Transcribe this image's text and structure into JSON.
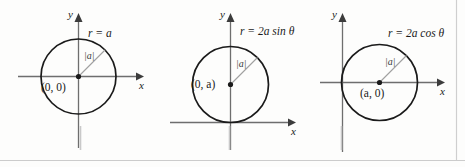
{
  "figure": {
    "title_alt": "Three polar-coordinate circle graphs",
    "background_color": "#fdfdfc",
    "curve_color": "#1a1a1a",
    "axis_color": "#6e6e6e",
    "radius_color": "#9a9a9a",
    "rule_color": "#c8c8c8"
  },
  "panels": [
    {
      "id": "panel-center-origin",
      "equation": "r = a",
      "equation_parts": {
        "lhs": "r",
        "eq": "=",
        "rhs": "a"
      },
      "center_label": "(0, 0)",
      "radius_label": "|a|",
      "x_axis_label": "x",
      "y_axis_label": "y",
      "center": {
        "x": 0,
        "y": 0
      },
      "radius_expr": "a"
    },
    {
      "id": "panel-center-on-y",
      "equation": "r = 2a sin θ",
      "equation_parts": {
        "lhs": "r",
        "eq": "=",
        "rhs": "2a sin θ"
      },
      "center_label": "(0, a)",
      "radius_label": "|a|",
      "x_axis_label": "x",
      "y_axis_label": "y",
      "center": {
        "x": 0,
        "y": "a"
      },
      "radius_expr": "a"
    },
    {
      "id": "panel-center-on-x",
      "equation": "r = 2a cos θ",
      "equation_parts": {
        "lhs": "r",
        "eq": "=",
        "rhs": "2a cos θ"
      },
      "center_label": "(a, 0)",
      "radius_label": "|a|",
      "x_axis_label": "x",
      "y_axis_label": "y",
      "center": {
        "x": "a",
        "y": 0
      },
      "radius_expr": "a"
    }
  ],
  "separators": {
    "count": 3,
    "note": "vertical rules between and after panels"
  },
  "bottom_rule": {
    "present": true
  }
}
